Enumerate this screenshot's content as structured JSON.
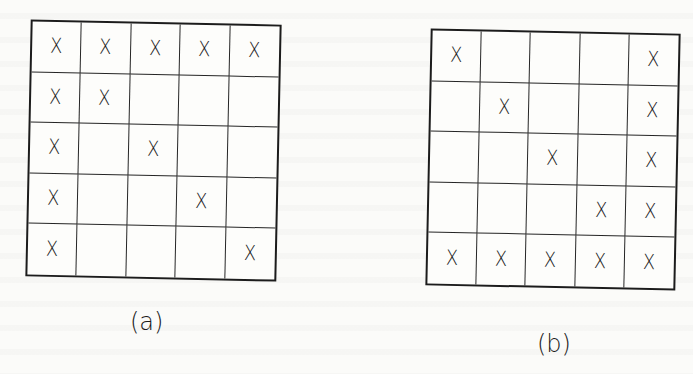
{
  "figures": [
    {
      "id": "a",
      "caption": "(a)",
      "rows": 5,
      "cols": 5,
      "cells": [
        [
          "X",
          "X",
          "X",
          "X",
          "X"
        ],
        [
          "X",
          "X",
          "",
          "",
          ""
        ],
        [
          "X",
          "",
          "X",
          "",
          ""
        ],
        [
          "X",
          "",
          "",
          "X",
          ""
        ],
        [
          "X",
          "",
          "",
          "",
          "X"
        ]
      ]
    },
    {
      "id": "b",
      "caption": "(b)",
      "rows": 5,
      "cols": 5,
      "cells": [
        [
          "X",
          "",
          "",
          "",
          "X"
        ],
        [
          "",
          "X",
          "",
          "",
          "X"
        ],
        [
          "",
          "",
          "X",
          "",
          "X"
        ],
        [
          "",
          "",
          "",
          "X",
          "X"
        ],
        [
          "X",
          "X",
          "X",
          "X",
          "X"
        ]
      ]
    }
  ],
  "colors": {
    "background": "#fbfbf9",
    "ink": "#1a1a1a"
  }
}
